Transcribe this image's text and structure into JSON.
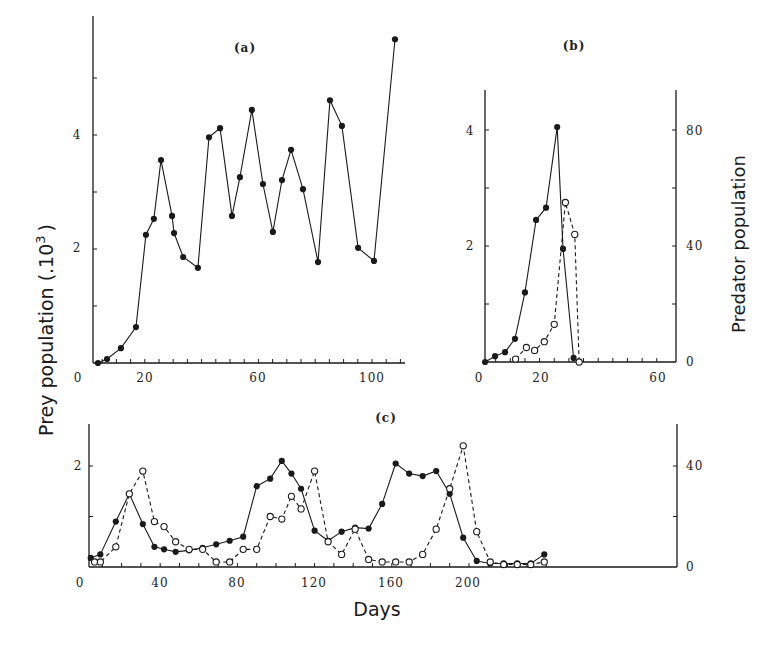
{
  "figure": {
    "ylabel_left": "Prey population (.10",
    "ylabel_left_sup": "3",
    "ylabel_left_close": ")",
    "ylabel_right": "Predator population",
    "xlabel": "Days"
  },
  "colors": {
    "ink": "#1a1a1a",
    "background": "#ffffff"
  },
  "chart_data": [
    {
      "type": "line",
      "title": "(a)",
      "xlabel": "Days",
      "ylabel": "Prey population (.10^3)",
      "xlim": [
        0,
        110
      ],
      "ylim": [
        0,
        5.7
      ],
      "x_ticks": [
        0,
        20,
        60,
        100
      ],
      "y_ticks": [
        2,
        4
      ],
      "grid": false,
      "series": [
        {
          "name": "Prey",
          "marker": "filled-circle",
          "line": "solid",
          "x": [
            3.5,
            6.7,
            11.6,
            16.9,
            20.4,
            23.2,
            25.7,
            29.6,
            30.3,
            33.5,
            38.7,
            42.6,
            46.5,
            50.7,
            53.5,
            57.7,
            61.6,
            65.1,
            68.3,
            71.5,
            75.7,
            81.0,
            85.2,
            89.4,
            95.1,
            100.7,
            108.1
          ],
          "values": [
            0.0,
            0.07,
            0.26,
            0.63,
            2.25,
            2.53,
            3.56,
            2.58,
            2.28,
            1.86,
            1.67,
            3.96,
            4.12,
            2.58,
            3.26,
            4.44,
            3.14,
            2.3,
            3.21,
            3.74,
            3.05,
            1.77,
            4.61,
            4.16,
            2.02,
            1.79,
            5.68
          ]
        }
      ]
    },
    {
      "type": "line",
      "title": "(b)",
      "xlabel": "Days",
      "ylabel": "Prey population (.10^3)",
      "ylabel_right": "Predator population",
      "xlim": [
        0,
        66
      ],
      "ylim": [
        0,
        4.7
      ],
      "ylim_right": [
        0,
        94
      ],
      "x_ticks": [
        0,
        20,
        60
      ],
      "y_ticks": [
        2,
        4
      ],
      "y_ticks_right": [
        0,
        40,
        80
      ],
      "grid": false,
      "series": [
        {
          "name": "Prey",
          "axis": "left",
          "marker": "filled-circle",
          "line": "solid",
          "x": [
            1.4,
            4.8,
            8.2,
            11.6,
            15.0,
            18.8,
            22.2,
            26.0,
            28.0,
            31.6
          ],
          "values": [
            0.0,
            0.1,
            0.17,
            0.4,
            1.2,
            2.45,
            2.66,
            4.05,
            1.95,
            0.07
          ]
        },
        {
          "name": "Predator",
          "axis": "right",
          "marker": "open-circle",
          "line": "dashed",
          "x": [
            11.8,
            15.5,
            18.3,
            21.6,
            25.0,
            28.8,
            32.0,
            33.5
          ],
          "values": [
            1,
            5,
            4,
            7,
            13,
            55,
            44,
            0
          ]
        }
      ]
    },
    {
      "type": "line",
      "title": "(c)",
      "xlabel": "Days",
      "ylabel": "Prey population (.10^3)",
      "ylabel_right": "Predator population",
      "xlim": [
        0,
        245
      ],
      "ylim": [
        0,
        2.85
      ],
      "ylim_right": [
        0,
        57
      ],
      "x_ticks": [
        0,
        40,
        80,
        120,
        160,
        200
      ],
      "y_ticks": [
        2
      ],
      "y_ticks_right": [
        0,
        40
      ],
      "grid": false,
      "series": [
        {
          "name": "Prey",
          "axis": "left",
          "marker": "filled-circle",
          "line": "solid",
          "x": [
            4,
            9,
            17,
            24,
            31,
            37,
            42,
            48,
            55,
            62,
            69,
            76,
            83,
            90,
            97,
            103,
            108,
            113,
            120,
            127,
            134,
            141,
            148,
            155,
            162,
            169,
            176,
            183,
            190,
            197,
            204,
            211,
            218,
            225,
            232,
            239
          ],
          "values": [
            0.18,
            0.25,
            0.9,
            1.45,
            0.85,
            0.4,
            0.35,
            0.3,
            0.33,
            0.38,
            0.45,
            0.52,
            0.6,
            1.6,
            1.75,
            2.1,
            1.85,
            1.55,
            0.72,
            0.52,
            0.7,
            0.78,
            0.76,
            1.25,
            2.05,
            1.85,
            1.8,
            1.9,
            1.45,
            0.58,
            0.12,
            0.07,
            0.07,
            0.07,
            0.07,
            0.25
          ]
        },
        {
          "name": "Predator",
          "axis": "right",
          "marker": "open-circle",
          "line": "dashed",
          "x": [
            6,
            9,
            17,
            24,
            31,
            37,
            42,
            48,
            55,
            62,
            69,
            76,
            83,
            90,
            97,
            103,
            108,
            113,
            120,
            127,
            134,
            141,
            148,
            155,
            162,
            169,
            176,
            183,
            190,
            197,
            204,
            211,
            218,
            225,
            232,
            239
          ],
          "values": [
            2,
            2,
            8,
            29,
            38,
            18,
            16,
            10,
            7,
            7,
            2,
            2,
            7,
            7,
            20,
            19,
            28,
            23,
            38,
            10,
            5,
            15,
            3,
            2,
            2,
            2,
            5,
            15,
            31,
            48,
            14,
            2,
            1,
            1,
            1,
            2
          ]
        }
      ]
    }
  ],
  "panels": {
    "a": {
      "label": "(a)",
      "x_ticks": [
        "0",
        "20",
        "60",
        "100"
      ],
      "y_ticks": [
        "2",
        "4"
      ]
    },
    "b": {
      "label": "(b)",
      "x_ticks": [
        "0",
        "20",
        "60"
      ],
      "y_ticks": [
        "2",
        "4"
      ],
      "y_ticks_right": [
        "0",
        "40",
        "80"
      ]
    },
    "c": {
      "label": "(c)",
      "x_ticks": [
        "0",
        "40",
        "80",
        "120",
        "160",
        "200"
      ],
      "y_ticks": [
        "2"
      ],
      "y_ticks_right": [
        "0",
        "40"
      ]
    }
  }
}
